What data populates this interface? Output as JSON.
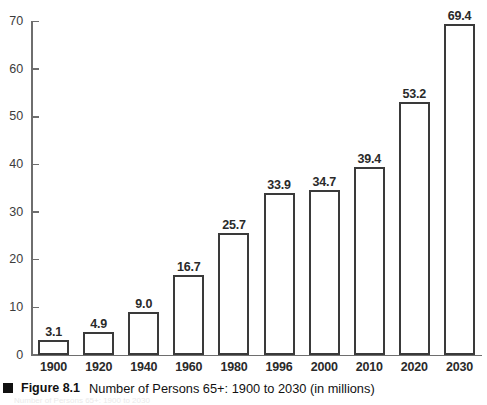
{
  "figure": {
    "bullet_icon": "black-square-bullet",
    "label": "Figure 8.1",
    "caption": "Number of Persons 65+: 1900 to 2030 (in millions)",
    "bleed_text": "Number of Persons 65+: 1900 to 2030"
  },
  "chart_data": {
    "type": "bar",
    "title": "Number of Persons 65+: 1900 to 2030 (in millions)",
    "xlabel": "",
    "ylabel": "",
    "ylim": [
      0,
      70
    ],
    "yticks": [
      0,
      10,
      20,
      30,
      40,
      50,
      60,
      70
    ],
    "ytick_labels": [
      "0",
      "10",
      "20",
      "30",
      "40",
      "50",
      "60",
      "70"
    ],
    "grid": false,
    "legend": false,
    "bar_style": {
      "fill": "#ffffff",
      "edge": "#3a3a3a",
      "edge_width": 2
    },
    "axis_color": "#6e6e6e",
    "categories": [
      "1900",
      "1920",
      "1940",
      "1960",
      "1980",
      "1996",
      "2000",
      "2010",
      "2020",
      "2030"
    ],
    "values": [
      3.1,
      4.9,
      9.0,
      16.7,
      25.7,
      33.9,
      34.7,
      39.4,
      53.2,
      69.4
    ],
    "value_labels": [
      "3.1",
      "4.9",
      "9.0",
      "16.7",
      "25.7",
      "33.9",
      "34.7",
      "39.4",
      "53.2",
      "69.4"
    ]
  }
}
